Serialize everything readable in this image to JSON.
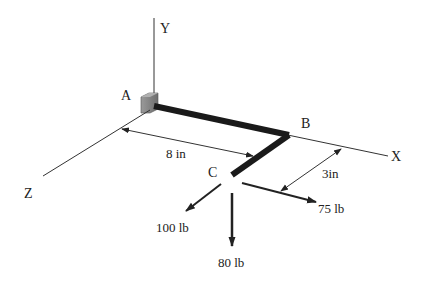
{
  "axes": {
    "x_label": "X",
    "y_label": "Y",
    "z_label": "Z"
  },
  "points": {
    "a": "A",
    "b": "B",
    "c": "C"
  },
  "dimensions": {
    "ab_length": "8 in",
    "bc_length": "3in"
  },
  "forces": {
    "z_direction": "100 lb",
    "y_direction": "80 lb",
    "x_direction": "75 lb"
  },
  "colors": {
    "beam": "#1a1a1a",
    "line": "#333333",
    "wall": "#8a8a8a",
    "wall_dark": "#5a5a5a"
  }
}
